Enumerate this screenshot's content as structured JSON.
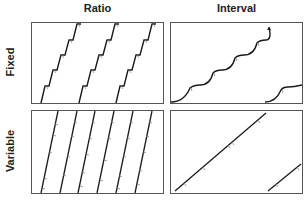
{
  "columns": [
    {
      "label": "Ratio"
    },
    {
      "label": "Interval"
    }
  ],
  "rows": [
    {
      "label": "Fixed"
    },
    {
      "label": "Variable"
    }
  ],
  "panels": [
    {
      "name": "fixed-ratio",
      "description": "Steep staircase cumulative records with brief post-reinforcement pauses"
    },
    {
      "name": "fixed-interval",
      "description": "Scalloped cumulative record curves"
    },
    {
      "name": "variable-ratio",
      "description": "Steep, steady straight cumulative lines"
    },
    {
      "name": "variable-interval",
      "description": "Moderate, steady straight cumulative lines"
    }
  ],
  "colors": {
    "line": "#1a1a1a",
    "border": "#555555",
    "tick": "#777777"
  }
}
